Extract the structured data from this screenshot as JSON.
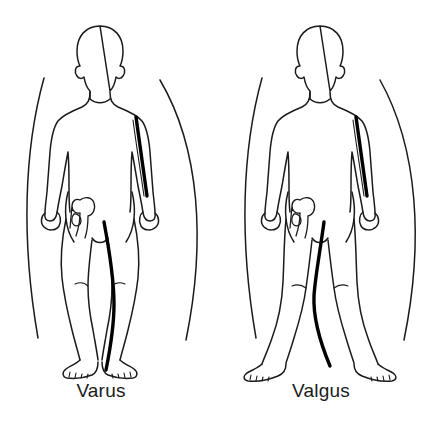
{
  "illustration": {
    "kind": "medical-line-drawing",
    "subject": "knee alignment comparison",
    "background_color": "#ffffff",
    "stroke_color": "#1b1b1b",
    "axis_line_color": "#000000",
    "label_color": "#1b1b1b",
    "canvas": {
      "width": 441,
      "height": 436
    }
  },
  "figures": [
    {
      "id": "varus",
      "label": "Varus",
      "label_center_x": 101,
      "label_baseline_y": 400,
      "description": "bow-legged alignment, knees apart, ankles together",
      "center_x": 100,
      "head_top_y": 25,
      "feet_y": 372,
      "arc_left_x": 22,
      "arc_right_x": 213,
      "axis_side": "left-leg"
    },
    {
      "id": "valgus",
      "label": "Valgus",
      "label_center_x": 321,
      "label_baseline_y": 400,
      "description": "knock-kneed alignment, knees together, ankles apart",
      "center_x": 320,
      "head_top_y": 25,
      "feet_y": 372,
      "arc_left_x": 238,
      "arc_right_x": 421,
      "axis_side": "left-leg"
    }
  ],
  "annotations": {
    "arc_count": 4,
    "axis_line_count": 4,
    "hip_detail": "femoral head and greater trochanter sketch"
  }
}
